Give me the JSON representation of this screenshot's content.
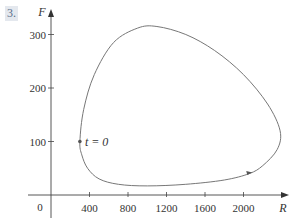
{
  "problem_number": "3.",
  "chart_data": {
    "type": "line",
    "title": "",
    "xlabel": "R",
    "ylabel": "F",
    "origin_label": "0",
    "x_ticks": [
      400,
      800,
      1200,
      1600,
      2000
    ],
    "x_tick_labels": [
      "400",
      "800",
      "1200",
      "1600",
      "2000"
    ],
    "y_ticks": [
      100,
      200,
      300
    ],
    "y_tick_labels": [
      "100",
      "200",
      "300"
    ],
    "xlim": [
      0,
      2500
    ],
    "ylim": [
      0,
      330
    ],
    "grid": false,
    "legend": null,
    "series": [
      {
        "name": "phase trajectory (R(t), F(t))",
        "closed_curve": true,
        "points_R": [
          300,
          340,
          450,
          650,
          900,
          1100,
          1400,
          1700,
          2000,
          2250,
          2380,
          2350,
          2200,
          2060,
          1800,
          1400,
          1000,
          700,
          500,
          380,
          320,
          300
        ],
        "points_F": [
          100,
          160,
          225,
          285,
          312,
          315,
          300,
          270,
          225,
          170,
          120,
          85,
          55,
          40,
          28,
          20,
          17,
          20,
          30,
          50,
          75,
          100
        ]
      }
    ],
    "annotations": [
      {
        "text": "t = 0",
        "R": 300,
        "F": 100,
        "marker": "dot"
      },
      {
        "text": "",
        "R": 2060,
        "F": 40,
        "marker": "direction-arrow"
      }
    ]
  }
}
